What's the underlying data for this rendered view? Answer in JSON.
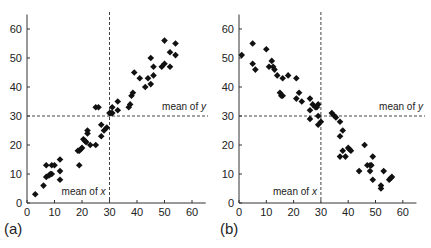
{
  "chart_data": [
    {
      "type": "scatter",
      "panel_label": "(a)",
      "title": "",
      "xlabel": "",
      "ylabel": "",
      "xlim": [
        0,
        65
      ],
      "ylim": [
        0,
        65
      ],
      "xticks": [
        0,
        10,
        20,
        30,
        40,
        50,
        60
      ],
      "yticks": [
        0,
        10,
        20,
        30,
        40,
        50,
        60
      ],
      "grid": false,
      "marker": "diamond",
      "annotations": [
        {
          "text": "mean of x",
          "type": "vline",
          "value": 30
        },
        {
          "text": "mean of y",
          "type": "hline",
          "value": 30
        }
      ],
      "points": [
        [
          3,
          3
        ],
        [
          6,
          6
        ],
        [
          7,
          9
        ],
        [
          7,
          13
        ],
        [
          8,
          9.5
        ],
        [
          8.5,
          10
        ],
        [
          9,
          10
        ],
        [
          9,
          13
        ],
        [
          10,
          13
        ],
        [
          12,
          8
        ],
        [
          12,
          11
        ],
        [
          12,
          15
        ],
        [
          19,
          13
        ],
        [
          18.5,
          18
        ],
        [
          19,
          18
        ],
        [
          19.5,
          18.5
        ],
        [
          20,
          19
        ],
        [
          20.5,
          22
        ],
        [
          21,
          21.5
        ],
        [
          21.5,
          21
        ],
        [
          22,
          24
        ],
        [
          22,
          25
        ],
        [
          23,
          20
        ],
        [
          25,
          20
        ],
        [
          25,
          33
        ],
        [
          26,
          33
        ],
        [
          27,
          23
        ],
        [
          27,
          27
        ],
        [
          28,
          25
        ],
        [
          29,
          26
        ],
        [
          30,
          31
        ],
        [
          30.5,
          31
        ],
        [
          31,
          31
        ],
        [
          31,
          33
        ],
        [
          33,
          32
        ],
        [
          33,
          35
        ],
        [
          37,
          33
        ],
        [
          37.5,
          34
        ],
        [
          38,
          37
        ],
        [
          38.5,
          38
        ],
        [
          39,
          45
        ],
        [
          41,
          43
        ],
        [
          43,
          40
        ],
        [
          44,
          43
        ],
        [
          45,
          41
        ],
        [
          45,
          50
        ],
        [
          46,
          44
        ],
        [
          46,
          47
        ],
        [
          49,
          47
        ],
        [
          50,
          48
        ],
        [
          50,
          56
        ],
        [
          52,
          47
        ],
        [
          52,
          52
        ],
        [
          54,
          51
        ],
        [
          54,
          55
        ]
      ]
    },
    {
      "type": "scatter",
      "panel_label": "(b)",
      "title": "",
      "xlabel": "",
      "ylabel": "",
      "xlim": [
        0,
        65
      ],
      "ylim": [
        0,
        65
      ],
      "xticks": [
        0,
        10,
        20,
        30,
        40,
        50,
        60
      ],
      "yticks": [
        0,
        10,
        20,
        30,
        40,
        50,
        60
      ],
      "grid": false,
      "marker": "diamond",
      "annotations": [
        {
          "text": "mean of x",
          "type": "vline",
          "value": 30
        },
        {
          "text": "mean of y",
          "type": "hline",
          "value": 30
        }
      ],
      "points": [
        [
          1,
          51
        ],
        [
          5,
          55
        ],
        [
          5,
          48
        ],
        [
          6,
          46
        ],
        [
          10,
          53
        ],
        [
          11,
          47
        ],
        [
          12,
          49
        ],
        [
          12.5,
          47
        ],
        [
          13,
          46
        ],
        [
          14,
          44
        ],
        [
          15,
          38
        ],
        [
          15.5,
          37
        ],
        [
          16,
          43
        ],
        [
          16,
          37
        ],
        [
          18,
          44
        ],
        [
          21,
          43
        ],
        [
          21,
          36
        ],
        [
          22,
          38
        ],
        [
          23,
          35
        ],
        [
          26,
          36
        ],
        [
          26,
          32
        ],
        [
          26,
          29
        ],
        [
          27,
          34
        ],
        [
          28,
          33
        ],
        [
          28.5,
          33
        ],
        [
          29,
          34
        ],
        [
          29,
          30
        ],
        [
          29,
          27
        ],
        [
          30,
          28
        ],
        [
          34,
          31
        ],
        [
          35,
          30
        ],
        [
          35.5,
          29.5
        ],
        [
          37,
          28
        ],
        [
          37,
          23
        ],
        [
          37,
          16
        ],
        [
          38,
          25
        ],
        [
          38,
          18
        ],
        [
          39,
          16
        ],
        [
          40,
          19
        ],
        [
          40.5,
          18.5
        ],
        [
          41,
          18
        ],
        [
          44,
          11
        ],
        [
          46,
          20
        ],
        [
          47,
          13
        ],
        [
          48,
          13
        ],
        [
          48,
          11
        ],
        [
          48.5,
          13
        ],
        [
          49,
          8
        ],
        [
          49,
          16
        ],
        [
          52,
          6
        ],
        [
          52,
          5
        ],
        [
          53,
          11
        ],
        [
          55,
          8
        ],
        [
          55.5,
          8.5
        ],
        [
          56,
          9
        ]
      ]
    }
  ],
  "labels": {
    "panel_a": "(a)",
    "panel_b": "(b)",
    "mean_x": "mean of x",
    "mean_y": "mean of y"
  },
  "colors": {
    "marker": "#111111",
    "axis": "#333333",
    "text": "#222222"
  }
}
